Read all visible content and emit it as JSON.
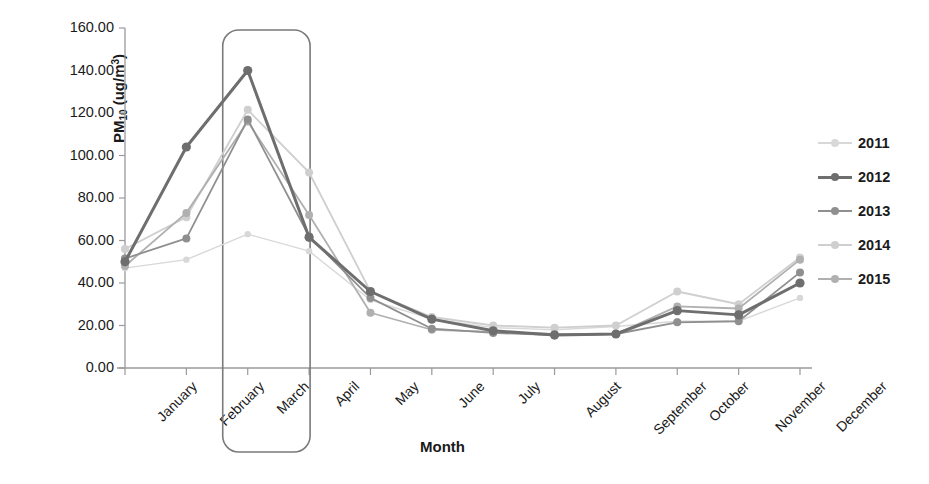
{
  "chart_data": {
    "type": "line",
    "title": "",
    "xlabel": "Month",
    "ylabel": "PM10 (ug/m3)",
    "ylabel_base": "PM",
    "ylabel_sub": "10",
    "ylabel_unit_pre": " (ug/m",
    "ylabel_unit_sup": "3",
    "ylabel_unit_post": ")",
    "categories": [
      "January",
      "February",
      "March",
      "April",
      "May",
      "June",
      "July",
      "August",
      "September",
      "October",
      "November",
      "December"
    ],
    "ylim": [
      0,
      160
    ],
    "ytick_values": [
      0,
      20,
      40,
      60,
      80,
      100,
      120,
      140,
      160
    ],
    "ytick_labels": [
      "0.00",
      "20.00",
      "40.00",
      "60.00",
      "80.00",
      "100.00",
      "120.00",
      "140.00",
      "160.00"
    ],
    "grid": false,
    "legend_position": "right",
    "series": [
      {
        "name": "2011",
        "color": "#d8d8d8",
        "width": 1.4,
        "marker": 3.2,
        "values": [
          47.0,
          51.0,
          63.0,
          55.0,
          32.0,
          23.0,
          19.0,
          18.0,
          19.5,
          22.0,
          22.0,
          33.0
        ]
      },
      {
        "name": "2012",
        "color": "#6e6e6e",
        "width": 3.0,
        "marker": 4.6,
        "values": [
          50.0,
          104.0,
          140.0,
          61.5,
          36.0,
          23.0,
          17.5,
          15.5,
          16.0,
          27.0,
          25.0,
          40.0
        ]
      },
      {
        "name": "2013",
        "color": "#8f8f8f",
        "width": 1.8,
        "marker": 4.0,
        "values": [
          51.5,
          61.0,
          117.0,
          62.0,
          33.0,
          18.5,
          16.5,
          15.5,
          16.0,
          21.5,
          22.0,
          45.0
        ]
      },
      {
        "name": "2014",
        "color": "#cfcfcf",
        "width": 1.8,
        "marker": 4.0,
        "values": [
          56.0,
          71.0,
          121.5,
          92.0,
          36.0,
          24.0,
          20.0,
          19.0,
          20.0,
          36.0,
          30.0,
          52.0
        ]
      },
      {
        "name": "2015",
        "color": "#b0b0b0",
        "width": 1.8,
        "marker": 4.0,
        "values": [
          48.0,
          73.0,
          116.0,
          72.0,
          26.0,
          18.0,
          17.0,
          16.0,
          16.0,
          29.0,
          28.0,
          51.0
        ]
      }
    ],
    "annotations": [
      {
        "type": "rounded-rect-highlight",
        "label": "March highlight box",
        "x_from": "March",
        "x_to": "April",
        "color": "#7a7a7a"
      }
    ]
  },
  "legend": {
    "entries": [
      "2011",
      "2012",
      "2013",
      "2014",
      "2015"
    ]
  },
  "axis": {
    "x_title": "Month",
    "line_color": "#9a9a9a"
  }
}
